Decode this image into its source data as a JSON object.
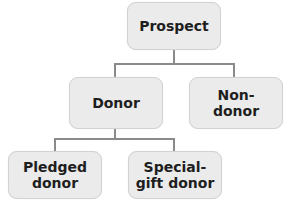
{
  "diagram": {
    "type": "hierarchy",
    "nodes": {
      "prospect": "Prospect",
      "donor": "Donor",
      "non_donor": "Non-\ndonor",
      "pledged_donor": "Pledged\ndonor",
      "special_gift_donor": "Special-\ngift donor"
    },
    "edges": [
      [
        "Prospect",
        "Donor"
      ],
      [
        "Prospect",
        "Non-donor"
      ],
      [
        "Donor",
        "Pledged donor"
      ],
      [
        "Donor",
        "Special-gift donor"
      ]
    ],
    "colors": {
      "box_fill": "#ebebeb",
      "box_border": "#d2d2d2",
      "connector": "#8a8a8a",
      "text": "#1e1e1e"
    }
  }
}
